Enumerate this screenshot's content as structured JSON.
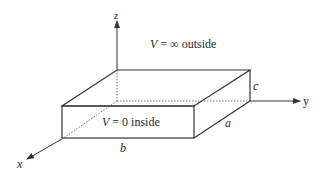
{
  "diagram": {
    "axes": {
      "x": {
        "label": "x"
      },
      "y": {
        "label": "y"
      },
      "z": {
        "label": "z"
      }
    },
    "box": {
      "dimensions": {
        "a": "a",
        "b": "b",
        "c": "c"
      }
    },
    "annotations": {
      "outside": {
        "var": "V",
        "eq": " = ∞ outside"
      },
      "inside": {
        "var": "V",
        "eq": " = 0 inside"
      }
    },
    "colors": {
      "line": "#333333",
      "background": "#ffffff"
    }
  }
}
